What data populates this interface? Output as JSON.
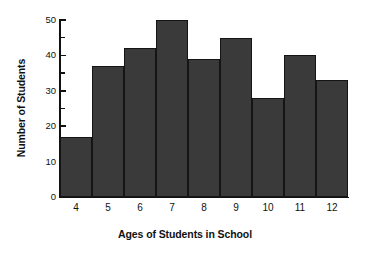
{
  "chart_data": {
    "type": "bar",
    "title": "",
    "xlabel": "Ages of Students in School",
    "ylabel": "Number of Students",
    "categories": [
      "4",
      "5",
      "6",
      "7",
      "8",
      "9",
      "10",
      "11",
      "12"
    ],
    "values": [
      17,
      37,
      42,
      50,
      39,
      45,
      28,
      40,
      33
    ],
    "ylim": [
      0,
      50
    ],
    "y_major_ticks": [
      0,
      10,
      20,
      30,
      40,
      50
    ],
    "y_minor_ticks": [
      5,
      15,
      25,
      35,
      45
    ],
    "y_tick_labels": [
      "0",
      "10",
      "20",
      "30",
      "40",
      "50"
    ],
    "grid": false,
    "legend": null,
    "bar_gap": 0,
    "colors": {
      "bar_fill": "#3a3a3a",
      "bar_edge": "#141414",
      "background": "#ffffff",
      "axis": "#111111",
      "text": "#111111"
    }
  }
}
